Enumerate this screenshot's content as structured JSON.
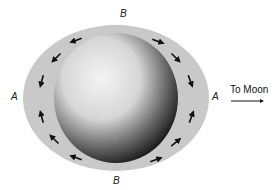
{
  "diagram": {
    "labels": {
      "top": "B",
      "bottom": "B",
      "left": "A",
      "right": "A"
    },
    "direction_label": "To Moon",
    "colors": {
      "background": "#ffffff",
      "tidal_bulge": "#c9c9c9",
      "earth_light": "#f2f2f2",
      "earth_dark": "#1a1a1a",
      "arrow": "#111111"
    },
    "flow_arrows": [
      {
        "x": 77,
        "y": 40,
        "angle": 200
      },
      {
        "x": 57,
        "y": 57,
        "angle": 225
      },
      {
        "x": 42,
        "y": 80,
        "angle": 255
      },
      {
        "x": 42,
        "y": 118,
        "angle": 105
      },
      {
        "x": 55,
        "y": 140,
        "angle": 135
      },
      {
        "x": 77,
        "y": 158,
        "angle": 160
      },
      {
        "x": 157,
        "y": 41,
        "angle": 340
      },
      {
        "x": 175,
        "y": 57,
        "angle": 315
      },
      {
        "x": 190,
        "y": 80,
        "angle": 290
      },
      {
        "x": 191,
        "y": 118,
        "angle": 70
      },
      {
        "x": 175,
        "y": 143,
        "angle": 40
      },
      {
        "x": 155,
        "y": 160,
        "angle": 20
      }
    ]
  }
}
